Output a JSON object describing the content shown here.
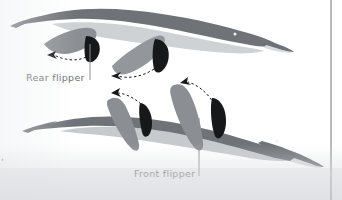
{
  "figure": {
    "kind": "scanned-textbook-illustration",
    "background_color": "#ffffff",
    "page_tint_color": "#e9ebee"
  },
  "labels": [
    {
      "id": "rear-flipper",
      "text": "Rear flipper",
      "color": "#6b6e72",
      "x": 26,
      "y": 81,
      "leader": {
        "x": 90,
        "y_top": 44,
        "y_bottom": 80,
        "color": "#8c8f93"
      }
    },
    {
      "id": "front-flipper",
      "text": "Front flipper",
      "color": "#6b6e72",
      "x": 134,
      "y": 177,
      "leader": {
        "x": 199,
        "y_top": 118,
        "y_bottom": 176,
        "color": "#8c8f93"
      }
    }
  ],
  "edge_artifacts": {
    "left_text_fragment": ",",
    "left_text_fragment_color": "#4a4c50",
    "page_rule": {
      "name": "page-margin-rule",
      "x": 331,
      "y_top": 0,
      "y_bottom": 200,
      "color": "#9a9da1",
      "width": 1.4
    }
  },
  "palette": {
    "body_dark": "#6f7377",
    "body_dark_edge": "#5f6367",
    "belly_light": "#cfd2d5",
    "belly_light_2": "#c7cacd",
    "flipper_mid": "#8b8e92",
    "flipper_mid_2": "#93969a",
    "flipper_black": "#17181a",
    "arrow_black": "#17181a",
    "snout_light": "#d9dbde",
    "eye": "#f2f3f4"
  },
  "animals": [
    {
      "id": "upper-animal",
      "name": "upper-marine-reptile",
      "facing": "right",
      "eye": {
        "cx": 235,
        "cy": 34,
        "r": 1.5
      },
      "parts": [
        "tail",
        "body",
        "belly",
        "head",
        "snout",
        "rear-flipper-mid",
        "rear-flipper-black",
        "front-flipper-mid",
        "front-flipper-black"
      ]
    },
    {
      "id": "lower-animal",
      "name": "lower-marine-reptile",
      "facing": "right",
      "eye": {
        "cx": 277,
        "cy": 136,
        "r": 1.5
      },
      "parts": [
        "tail",
        "body",
        "belly",
        "head",
        "snout",
        "rear-flipper-mid",
        "rear-flipper-black",
        "front-flipper-mid",
        "front-flipper-black"
      ]
    }
  ],
  "motion_arrows": [
    {
      "id": "arrow-1",
      "name": "rear-flipper-stroke-arrow-upper",
      "direction": "left",
      "dash": "2.4 2.4",
      "color": "#17181a"
    },
    {
      "id": "arrow-2",
      "name": "front-flipper-stroke-arrow-upper",
      "direction": "left",
      "dash": "2.4 2.4",
      "color": "#17181a"
    },
    {
      "id": "arrow-3",
      "name": "rear-flipper-stroke-arrow-lower",
      "direction": "up-left",
      "dash": "2.4 2.4",
      "color": "#17181a"
    },
    {
      "id": "arrow-4",
      "name": "front-flipper-stroke-arrow-lower",
      "direction": "up-left",
      "dash": "2.4 2.4",
      "color": "#17181a"
    }
  ]
}
